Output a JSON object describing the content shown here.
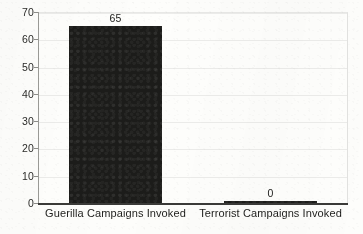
{
  "chart_data": {
    "type": "bar",
    "title": "",
    "subtitle": "",
    "xlabel": "",
    "ylabel": "",
    "categories": [
      "Guerilla Campaigns Invoked",
      "Terrorist Campaigns Invoked"
    ],
    "values": [
      65,
      0
    ],
    "data_labels": [
      "65",
      "0"
    ],
    "ylim": [
      0,
      70
    ],
    "ytick_step": 10,
    "yticks": [
      70,
      60,
      50,
      40,
      30,
      20,
      10,
      0
    ],
    "ytick_labels": [
      "70",
      "60",
      "50",
      "40",
      "30",
      "20",
      "10",
      "0"
    ],
    "grid": true,
    "legend": false,
    "legend_position": "none",
    "bar_color": "#1c1c1a",
    "gridline_color": "#ececea",
    "axis_color": "#3a3a38",
    "background_color": "#fdfdfb",
    "text_color": "#20201e"
  }
}
